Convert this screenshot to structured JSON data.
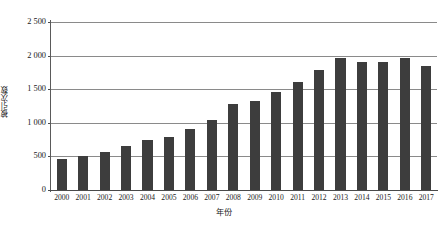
{
  "chart_data": {
    "type": "bar",
    "title": "",
    "subtitle": "",
    "xlabel": "年份",
    "ylabel": "被引次数",
    "categories": [
      "2000",
      "2001",
      "2002",
      "2003",
      "2004",
      "2005",
      "2006",
      "2007",
      "2008",
      "2009",
      "2010",
      "2011",
      "2012",
      "2013",
      "2014",
      "2015",
      "2016",
      "2017"
    ],
    "values": [
      460,
      500,
      560,
      660,
      750,
      790,
      910,
      1040,
      1280,
      1330,
      1460,
      1600,
      1780,
      1970,
      1900,
      1900,
      1960,
      1850
    ],
    "ylim": [
      0,
      2500
    ],
    "ytick_values": [
      0,
      500,
      1000,
      1500,
      2000,
      2500
    ],
    "ytick_labels": [
      "0",
      "500",
      "1 000",
      "1 500",
      "2 000",
      "2 500"
    ],
    "grid": true,
    "legend": false,
    "legend_position": "none",
    "series": [
      {
        "name": "被引次数",
        "values": [
          460,
          500,
          560,
          660,
          750,
          790,
          910,
          1040,
          1280,
          1330,
          1460,
          1600,
          1780,
          1970,
          1900,
          1900,
          1960,
          1850
        ]
      }
    ],
    "colors": {
      "bar": "#3d3d3d",
      "gridline": "#8a8a8a",
      "axis": "#4a4a4a",
      "text": "#1a1a1a",
      "background": "#ffffff"
    }
  }
}
